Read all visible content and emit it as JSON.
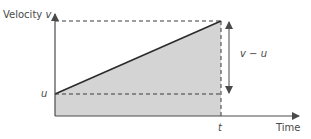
{
  "diagram": {
    "y_axis_label": "Velocity",
    "y_axis_symbol": "v",
    "x_axis_label": "Time",
    "initial_velocity_label": "u",
    "time_label": "t",
    "difference_label": "v − u",
    "colors": {
      "axes": "#4a4a4a",
      "line": "#2b2b2b",
      "fill": "#d4d4d4",
      "dashed": "#3a3a3a",
      "text": "#4a4a4a"
    }
  }
}
